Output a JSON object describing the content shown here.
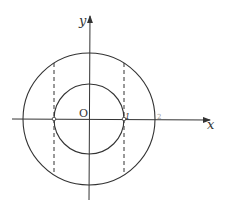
{
  "diagram": {
    "labels": {
      "x_axis": "x",
      "y_axis": "y",
      "origin": "O",
      "inner_radius_label": "1",
      "outer_radius_label": "2"
    },
    "geometry": {
      "center": [
        89,
        119
      ],
      "inner_radius": 35,
      "outer_radius": 66,
      "dashed_lines_x": [
        54,
        124
      ]
    },
    "colors": {
      "stroke": "#333333",
      "background": "#ffffff"
    }
  }
}
